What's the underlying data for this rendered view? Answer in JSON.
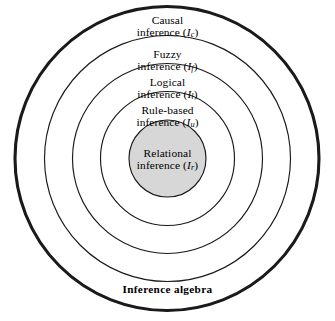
{
  "diagram": {
    "geometry": {
      "center_x": 167,
      "center_y": 158,
      "outer_radius": 152,
      "ring_radii": [
        152,
        123,
        95,
        67,
        39
      ]
    },
    "colors": {
      "stroke": "#1a1a1a",
      "background": "#ffffff",
      "core_fill": "#d7d7d7",
      "ring_fill": "#ffffff"
    },
    "rings": [
      {
        "name": "causal",
        "label_line1": "Causal",
        "label_line2_prefix": "inference (",
        "symbol": "I",
        "subscript": "c",
        "label_line2_suffix": ")",
        "stroke_width": 3.1,
        "fill": "#ffffff"
      },
      {
        "name": "fuzzy",
        "label_line1": "Fuzzy",
        "label_line2_prefix": "inference (",
        "symbol": "I",
        "subscript": "f",
        "label_line2_suffix": ")",
        "stroke_width": 1.1,
        "fill": "#ffffff"
      },
      {
        "name": "logical",
        "label_line1": "Logical",
        "label_line2_prefix": "inference (",
        "symbol": "I",
        "subscript": "l",
        "label_line2_suffix": ")",
        "stroke_width": 1.1,
        "fill": "#ffffff"
      },
      {
        "name": "rule-based",
        "label_line1": "Rule-based",
        "label_line2_prefix": "inference (",
        "symbol": "I",
        "subscript": "u",
        "label_line2_suffix": ")",
        "stroke_width": 1.1,
        "fill": "#ffffff"
      },
      {
        "name": "relational",
        "label_line1": "Relational",
        "label_line2_prefix": "inference (",
        "symbol": "I",
        "subscript": "r",
        "label_line2_suffix": ")",
        "stroke_width": 1.1,
        "fill": "#d7d7d7"
      }
    ],
    "caption": {
      "text": "Inference algebra"
    }
  }
}
